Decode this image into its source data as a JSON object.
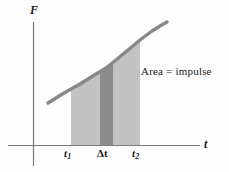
{
  "figure": {
    "title_hidden": "Force versus time graph illustrating impulse as area under the curve",
    "axes": {
      "y_label": "F",
      "x_label": "t",
      "origin_px": [
        33,
        145
      ],
      "y_axis_top_px": 22,
      "y_axis_bottom_px": 166,
      "x_axis_left_px": 8,
      "x_axis_right_px": 200,
      "axis_color": "#7a7a7a"
    },
    "annotation": {
      "text": "Area  =  impulse",
      "color": "#2a2a2a"
    },
    "ticks": [
      {
        "name": "t1",
        "base": "t",
        "sub": "1",
        "x_px": 71
      },
      {
        "name": "delta-t",
        "base": "Δt",
        "sub": "",
        "x_px": 106
      },
      {
        "name": "t2",
        "base": "t",
        "sub": "2",
        "x_px": 140
      }
    ],
    "regions": {
      "impulse_area": {
        "label": "impulse-area",
        "fill": "#c2c2c2",
        "x_start_px": 71,
        "x_end_px": 140
      },
      "delta_t_strip": {
        "label": "delta-t-strip",
        "fill": "#8c8c8c",
        "x_start_px": 100,
        "x_end_px": 113
      }
    },
    "curve": {
      "label": "force-curve",
      "color": "#888888",
      "stroke_width": 3.4,
      "points_px": [
        [
          48,
          103
        ],
        [
          64,
          93
        ],
        [
          80,
          84
        ],
        [
          96,
          74
        ],
        [
          106,
          68
        ],
        [
          116,
          60
        ],
        [
          128,
          50
        ],
        [
          140,
          40
        ],
        [
          152,
          31
        ],
        [
          160,
          26
        ],
        [
          167,
          22
        ]
      ]
    }
  },
  "chart_data": {
    "type": "line",
    "title": "",
    "xlabel": "t",
    "ylabel": "F",
    "annotations": [
      "Area  =  impulse"
    ],
    "tick_labels_x": [
      "t₁",
      "Δt",
      "t₂"
    ],
    "tick_labels_y": [],
    "grid": false,
    "legend": "none",
    "series": [
      {
        "name": "F(t)",
        "x": [
          0.18,
          0.32,
          0.45,
          0.58,
          0.66,
          0.74,
          0.83,
          0.93,
          1.02,
          1.08,
          1.14
        ],
        "y": [
          0.34,
          0.43,
          0.5,
          0.58,
          0.63,
          0.7,
          0.78,
          0.86,
          0.93,
          0.97,
          1.0
        ]
      }
    ],
    "shaded_regions": [
      {
        "name": "impulse-area",
        "x_from": "t1",
        "x_to": "t2",
        "color": "#c2c2c2",
        "meaning": "Area = impulse"
      },
      {
        "name": "delta-t-strip",
        "x_from": "t1+Δ",
        "x_to": "t1+2Δ",
        "color": "#8c8c8c",
        "meaning": "narrow strip of width Δt"
      }
    ]
  }
}
